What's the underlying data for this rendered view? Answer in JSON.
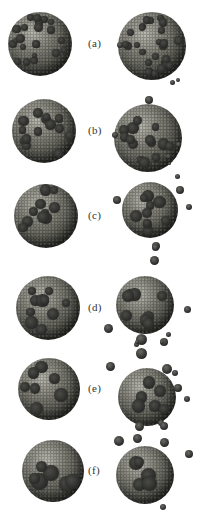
{
  "figure": {
    "panels": [
      {
        "label": "(a)",
        "top": 0,
        "height": 82,
        "left": {
          "x": 8,
          "y": 12,
          "size": 64,
          "patches": 22,
          "patch_size": 7
        },
        "right": {
          "x": 118,
          "y": 12,
          "size": 68,
          "patches": 26,
          "patch_size": 7
        },
        "fragments": [
          {
            "x": 117,
            "y": 42,
            "s": 6
          },
          {
            "x": 176,
            "y": 78,
            "s": 4
          }
        ]
      },
      {
        "label": "(b)",
        "top": 82,
        "height": 82,
        "left": {
          "x": 12,
          "y": 17,
          "size": 64,
          "patches": 14,
          "patch_size": 9
        },
        "right": {
          "x": 114,
          "y": 22,
          "size": 68,
          "patches": 14,
          "patch_size": 9
        },
        "fragments": [
          {
            "x": 145,
            "y": 14,
            "s": 8
          },
          {
            "x": 170,
            "y": -2,
            "s": 5
          },
          {
            "x": 112,
            "y": 50,
            "s": 6
          },
          {
            "x": 166,
            "y": 72,
            "s": 5
          },
          {
            "x": 176,
            "y": 60,
            "s": 5
          }
        ]
      },
      {
        "label": "(c)",
        "top": 164,
        "height": 84,
        "left": {
          "x": 14,
          "y": 20,
          "size": 64,
          "patches": 10,
          "patch_size": 10
        },
        "right": {
          "x": 122,
          "y": 18,
          "size": 56,
          "patches": 10,
          "patch_size": 10
        },
        "fragments": [
          {
            "x": 113,
            "y": 32,
            "s": 8
          },
          {
            "x": 175,
            "y": 10,
            "s": 5
          },
          {
            "x": 176,
            "y": 22,
            "s": 8
          },
          {
            "x": 186,
            "y": 40,
            "s": 6
          },
          {
            "x": 152,
            "y": 78,
            "s": 8
          },
          {
            "x": 168,
            "y": -2,
            "s": 3
          }
        ]
      },
      {
        "label": "(d)",
        "top": 248,
        "height": 96,
        "left": {
          "x": 16,
          "y": 28,
          "size": 64,
          "patches": 10,
          "patch_size": 10
        },
        "right": {
          "x": 116,
          "y": 28,
          "size": 58,
          "patches": 8,
          "patch_size": 10
        },
        "fragments": [
          {
            "x": 150,
            "y": 8,
            "s": 9
          },
          {
            "x": 152,
            "y": -4,
            "s": 7
          },
          {
            "x": 104,
            "y": 76,
            "s": 9
          },
          {
            "x": 184,
            "y": 58,
            "s": 7
          },
          {
            "x": 136,
            "y": 86,
            "s": 11
          },
          {
            "x": 160,
            "y": 90,
            "s": 8
          },
          {
            "x": 166,
            "y": 84,
            "s": 5
          },
          {
            "x": 134,
            "y": 94,
            "s": 5
          }
        ]
      },
      {
        "label": "(e)",
        "top": 344,
        "height": 80,
        "left": {
          "x": 18,
          "y": 14,
          "size": 62,
          "patches": 7,
          "patch_size": 12
        },
        "right": {
          "x": 118,
          "y": 24,
          "size": 58,
          "patches": 6,
          "patch_size": 11
        },
        "fragments": [
          {
            "x": 136,
            "y": 4,
            "s": 11
          },
          {
            "x": 106,
            "y": 18,
            "s": 9
          },
          {
            "x": 162,
            "y": 20,
            "s": 10
          },
          {
            "x": 172,
            "y": 26,
            "s": 6
          },
          {
            "x": 174,
            "y": 40,
            "s": 8
          },
          {
            "x": 184,
            "y": 52,
            "s": 6
          },
          {
            "x": 158,
            "y": 76,
            "s": 6
          },
          {
            "x": 135,
            "y": -4,
            "s": 4
          },
          {
            "x": 160,
            "y": -4,
            "s": 4
          }
        ]
      },
      {
        "label": "(f)",
        "top": 424,
        "height": 88,
        "left": {
          "x": 22,
          "y": 16,
          "size": 62,
          "patches": 6,
          "patch_size": 13
        },
        "right": {
          "x": 116,
          "y": 22,
          "size": 58,
          "patches": 5,
          "patch_size": 12
        },
        "fragments": [
          {
            "x": 114,
            "y": 12,
            "s": 10
          },
          {
            "x": 133,
            "y": 10,
            "s": 9
          },
          {
            "x": 160,
            "y": 14,
            "s": 9
          },
          {
            "x": 185,
            "y": 26,
            "s": 8
          },
          {
            "x": 160,
            "y": 80,
            "s": 6
          },
          {
            "x": 135,
            "y": -2,
            "s": 9
          },
          {
            "x": 160,
            "y": -2,
            "s": 8
          }
        ]
      }
    ]
  }
}
